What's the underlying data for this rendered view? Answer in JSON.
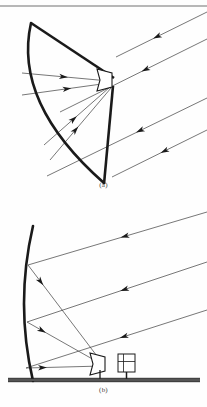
{
  "figure": {
    "background_color": "#fefefe",
    "ink_color": "#1a1a1a",
    "ray_color": "#4a4a4a",
    "caption_color": "#3b3b3b"
  },
  "panels": [
    {
      "id": "a",
      "caption": "(a)",
      "name": "front-fed-parabolic-reflector",
      "description": "Front-fed parabolic reflector with feed horn at focus supported by struts",
      "reflector": {
        "name": "parabolic-reflector-arc",
        "stroke_width": 2.6,
        "top_point": [
          31,
          23
        ],
        "bottom_point": [
          104,
          183
        ],
        "bulge_x": 13
      },
      "feed": {
        "name": "feed-horn",
        "focus_point": [
          112,
          80
        ],
        "mouth_point": [
          97,
          76
        ],
        "label": ""
      },
      "struts": [
        {
          "name": "upper-strut",
          "from": [
            31,
            23
          ],
          "to": [
            114,
            78
          ],
          "width": 2.6
        },
        {
          "name": "lower-strut",
          "from": [
            113,
            86
          ],
          "to": [
            104,
            184
          ],
          "width": 2.6
        }
      ],
      "incident_rays": [
        {
          "from": [
            207,
            12
          ],
          "to": [
            116,
            57
          ],
          "arrow_at": 0.55
        },
        {
          "from": [
            207,
            39
          ],
          "to": [
            60,
            112
          ],
          "arrow_at": 0.42
        },
        {
          "from": [
            207,
            98
          ],
          "to": [
            47,
            176
          ],
          "arrow_at": 0.42
        },
        {
          "from": [
            207,
            130
          ],
          "to": [
            112,
            177
          ],
          "arrow_at": 0.45
        }
      ],
      "reflected_rays": [
        {
          "from": [
            22,
            73
          ],
          "to": [
            109,
            81
          ],
          "arrow_at": 0.48
        },
        {
          "from": [
            22,
            95
          ],
          "to": [
            109,
            83
          ],
          "arrow_at": 0.52
        },
        {
          "from": [
            44,
            145
          ],
          "to": [
            110,
            87
          ],
          "arrow_at": 0.45
        },
        {
          "from": [
            50,
            160
          ],
          "to": [
            111,
            88
          ],
          "arrow_at": 0.42
        }
      ]
    },
    {
      "id": "b",
      "caption": "(b)",
      "name": "ground-mounted-offset-reflector",
      "description": "Tall offset reflector with ground-mounted horn feed and equipment module",
      "reflector": {
        "name": "offset-reflector-arc",
        "stroke_width": 2.6,
        "top_point": [
          33,
          226
        ],
        "bottom_point": [
          33,
          381
        ],
        "bulge_x": 15
      },
      "feed": {
        "name": "ground-feed-horn",
        "focus_point": [
          105,
          364
        ],
        "mouth_point": [
          104,
          360
        ],
        "label": ""
      },
      "ground": {
        "name": "ground-line",
        "y": 380,
        "x_start": 8,
        "x_end": 200,
        "thickness": 3.2
      },
      "equipment": {
        "name": "receiver-equipment-module",
        "x": 118,
        "y": 354,
        "width": 17,
        "height": 18
      },
      "incident_rays": [
        {
          "from": [
            207,
            212
          ],
          "to": [
            28,
            265
          ],
          "arrow_at": 0.46
        },
        {
          "from": [
            207,
            262
          ],
          "to": [
            27,
            322
          ],
          "arrow_at": 0.46
        },
        {
          "from": [
            207,
            310
          ],
          "to": [
            26,
            368
          ],
          "arrow_at": 0.46
        }
      ],
      "reflected_rays": [
        {
          "from": [
            28,
            265
          ],
          "to": [
            103,
            364
          ],
          "arrow_at": 0.17
        },
        {
          "from": [
            27,
            322
          ],
          "to": [
            103,
            365
          ],
          "arrow_at": 0.2
        },
        {
          "from": [
            26,
            368
          ],
          "to": [
            102,
            366
          ],
          "arrow_at": 0.22
        }
      ]
    }
  ],
  "page_rule": {
    "name": "page-top-rule",
    "y": 6,
    "x_start": 0,
    "x_end": 207
  }
}
